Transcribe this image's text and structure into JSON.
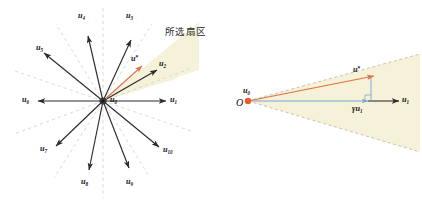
{
  "figure": {
    "background": "#ffffff",
    "sector_fill": "#f6f1d9",
    "sector_edge": "#c9c2a4",
    "vector_color": "#2b2b2b",
    "dashed_axis_color": "#d8d4c6",
    "accent_orange": "#e0703c",
    "accent_blue": "#6fa8dc",
    "origin_dot_color": "#ef5a2b"
  },
  "left_panel": {
    "name": "radial-vector-diagram",
    "origin_label": {
      "base": "u",
      "sub": "0"
    },
    "sector_annotation": "所选扇区",
    "vectors": [
      {
        "id": "u1",
        "base": "u",
        "sub": "1",
        "angle_deg": 0,
        "label_side": "right"
      },
      {
        "id": "u2",
        "base": "u",
        "sub": "2",
        "angle_deg": 30,
        "label_side": "right"
      },
      {
        "id": "u3",
        "base": "u",
        "sub": "3",
        "angle_deg": 65,
        "label_side": "right"
      },
      {
        "id": "u4",
        "base": "u",
        "sub": "4",
        "angle_deg": 100,
        "label_side": "left"
      },
      {
        "id": "u5",
        "base": "u",
        "sub": "5",
        "angle_deg": 140,
        "label_side": "left"
      },
      {
        "id": "u6",
        "base": "u",
        "sub": "6",
        "angle_deg": 180,
        "label_side": "left"
      },
      {
        "id": "u7",
        "base": "u",
        "sub": "7",
        "angle_deg": 215,
        "label_side": "left"
      },
      {
        "id": "u8",
        "base": "u",
        "sub": "8",
        "angle_deg": 258,
        "label_side": "left"
      },
      {
        "id": "u9",
        "base": "u",
        "sub": "9",
        "angle_deg": 287,
        "label_side": "right"
      },
      {
        "id": "u10",
        "base": "u",
        "sub": "10",
        "angle_deg": 325,
        "label_side": "right"
      }
    ],
    "target_vector": {
      "base": "u",
      "sub": "",
      "sup": "*",
      "color": "#e0703c"
    },
    "sector_span_deg": [
      0,
      30
    ]
  },
  "right_panel": {
    "name": "sector-detail-diagram",
    "origin_point_label": "O",
    "origin_vector_label": {
      "base": "u",
      "sub": "0"
    },
    "axis_vector_label": {
      "base": "u",
      "sub": "1"
    },
    "target_vector_label": {
      "base": "u",
      "sub": "",
      "sup": "*"
    },
    "projection_label": {
      "gamma": "γ",
      "base": "u",
      "sub": "1"
    },
    "right_angle_marker": true,
    "sector_fill": "#f6f1d9"
  }
}
